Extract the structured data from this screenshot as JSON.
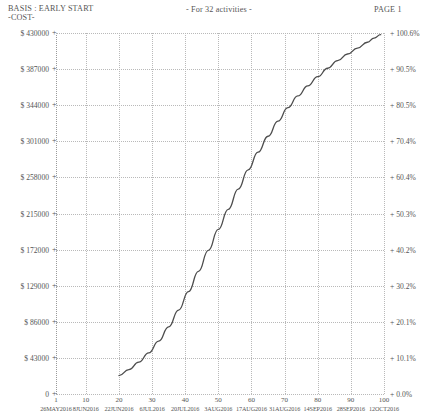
{
  "header": {
    "basis": "BASIS : EARLY START",
    "cost": "-COST-",
    "center": "- For  32 activities -",
    "page": "PAGE 1"
  },
  "chart_data": {
    "type": "line",
    "title": "BASIS : EARLY START -COST-",
    "subtitle": "- For  32 activities -",
    "xlabel": "",
    "ylabel": "-COST-",
    "y2label": "percent complete",
    "grid": true,
    "legend": "none",
    "xlim": [
      1,
      100
    ],
    "ylim": [
      0,
      430000
    ],
    "y2lim": [
      0.0,
      100.6
    ],
    "ytick_labels": [
      "$ 430000",
      "$ 387000",
      "$ 344000",
      "$ 301000",
      "$ 258000",
      "$ 215000",
      "$ 172000",
      "$ 129000",
      "$ 86000",
      "$ 43000",
      "0"
    ],
    "ytick_values": [
      430000,
      387000,
      344000,
      301000,
      258000,
      215000,
      172000,
      129000,
      86000,
      43000,
      0
    ],
    "y2tick_labels": [
      "+ 100.6%",
      "+ 90.5%",
      "+ 80.5%",
      "+ 70.4%",
      "+ 60.4%",
      "+ 50.3%",
      "+ 40.2%",
      "+ 30.2%",
      "+ 20.1%",
      "+ 10.1%",
      "+ 0.0%"
    ],
    "y2tick_values": [
      100.6,
      90.5,
      80.5,
      70.4,
      60.4,
      50.3,
      40.2,
      30.2,
      20.1,
      10.1,
      0.0
    ],
    "xtick_labels": [
      "1",
      "10",
      "20",
      "30",
      "40",
      "50",
      "60",
      "70",
      "80",
      "90",
      "100"
    ],
    "xtick_values": [
      1,
      10,
      20,
      30,
      40,
      50,
      60,
      70,
      80,
      90,
      100
    ],
    "xtick_dates": [
      "26MAY2016",
      "8JUN2016",
      "22JUN2016",
      "6JUL2016",
      "20JUL2016",
      "3AUG2016",
      "17AUG2016",
      "31AUG2016",
      "14SEP2016",
      "28SEP2016",
      "12OCT2016"
    ],
    "series": [
      {
        "name": "Cumulative cost (early start)",
        "color": "#4d4d4d",
        "x": [
          20,
          23,
          26,
          29,
          32,
          35,
          38,
          41,
          44,
          47,
          50,
          53,
          56,
          59,
          62,
          65,
          68,
          71,
          74,
          77,
          80,
          83,
          86,
          89,
          92,
          95,
          97,
          99
        ],
        "y": [
          22000,
          29000,
          38000,
          49000,
          63000,
          80000,
          100000,
          122000,
          146000,
          171000,
          196000,
          220000,
          244000,
          267000,
          288000,
          307000,
          325000,
          341000,
          355000,
          367000,
          378000,
          388000,
          397000,
          405000,
          412000,
          419000,
          424000,
          428000
        ],
        "percent": [
          5.1,
          6.8,
          8.9,
          11.5,
          14.7,
          18.7,
          23.4,
          28.5,
          34.2,
          40.0,
          45.9,
          51.5,
          57.1,
          62.5,
          67.4,
          71.8,
          76.1,
          79.8,
          83.1,
          85.9,
          88.5,
          90.8,
          92.9,
          94.8,
          96.4,
          98.0,
          99.2,
          100.1
        ]
      }
    ]
  }
}
